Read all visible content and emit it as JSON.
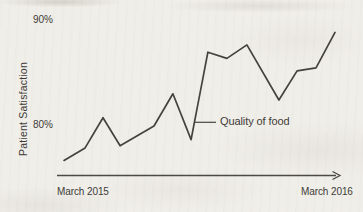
{
  "figure": {
    "y_axis_label": "Patient Satisfaction",
    "y_tick_top": "90%",
    "y_tick_bottom": "80%",
    "x_start_label": "March 2015",
    "x_end_label": "March 2016",
    "annotation_label": "Quality of food"
  },
  "colors": {
    "line": "#42413d",
    "axis": "#4a4844",
    "text": "#3c3a36",
    "paper": "#f0eee9"
  },
  "chart_data": {
    "type": "line",
    "title": "",
    "ylabel": "Patient Satisfaction",
    "yticks": [
      "80%",
      "90%"
    ],
    "ylim": [
      75.5,
      90.5
    ],
    "x_range_labels": [
      "March 2015",
      "March 2016"
    ],
    "x_axis_style": "timeline-arrow",
    "grid": false,
    "legend": false,
    "series": [
      {
        "name": "Patient Satisfaction",
        "points": [
          {
            "x_frac": 0.0,
            "value": 76.6
          },
          {
            "x_frac": 0.078,
            "value": 77.8
          },
          {
            "x_frac": 0.144,
            "value": 80.7
          },
          {
            "x_frac": 0.207,
            "value": 78.0
          },
          {
            "x_frac": 0.332,
            "value": 79.9
          },
          {
            "x_frac": 0.402,
            "value": 83.0
          },
          {
            "x_frac": 0.469,
            "value": 78.6
          },
          {
            "x_frac": 0.531,
            "value": 87.0
          },
          {
            "x_frac": 0.601,
            "value": 86.4
          },
          {
            "x_frac": 0.675,
            "value": 87.7
          },
          {
            "x_frac": 0.793,
            "value": 82.4
          },
          {
            "x_frac": 0.86,
            "value": 85.2
          },
          {
            "x_frac": 0.93,
            "value": 85.5
          },
          {
            "x_frac": 1.0,
            "value": 88.9
          }
        ]
      }
    ],
    "annotations": [
      {
        "text": "Quality of food",
        "target_point_index": 6,
        "leader": "horizontal-line-to-dip"
      }
    ]
  }
}
